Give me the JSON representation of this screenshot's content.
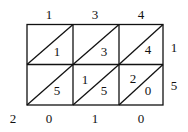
{
  "diagram": {
    "type": "lattice-multiplication",
    "multiplicand_digits": [
      "1",
      "3",
      "4"
    ],
    "multiplier_digits": [
      "1",
      "5"
    ],
    "cells": [
      [
        {
          "tens": "",
          "ones": "1"
        },
        {
          "tens": "",
          "ones": "3"
        },
        {
          "tens": "",
          "ones": "4"
        }
      ],
      [
        {
          "tens": "",
          "ones": "5"
        },
        {
          "tens": "1",
          "ones": "5"
        },
        {
          "tens": "2",
          "ones": "0"
        }
      ]
    ],
    "result_left": [
      "2"
    ],
    "result_bottom": [
      "0",
      "1",
      "0"
    ],
    "line_color": "#111111"
  }
}
